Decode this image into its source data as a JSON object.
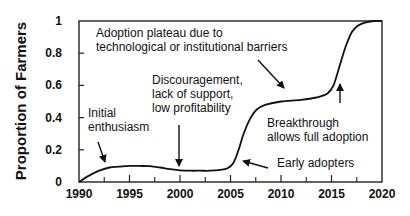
{
  "chart_data": {
    "type": "line",
    "title": "",
    "xlabel": "",
    "ylabel": "Proportion of Farmers",
    "xlim": [
      1990,
      2020
    ],
    "ylim": [
      0,
      1
    ],
    "grid": false,
    "legend": null,
    "x_ticks": [
      1990,
      1995,
      2000,
      2005,
      2010,
      2015,
      2020
    ],
    "x_minor_ticks": [
      1992.5,
      1997.5,
      2002.5,
      2007.5,
      2012.5,
      2017.5
    ],
    "y_ticks": [
      0,
      0.2,
      0.4,
      0.6,
      0.8,
      1
    ],
    "y_tick_labels": [
      "0",
      "0.2",
      "0.4",
      "0.6",
      "0.8",
      "1"
    ],
    "x_tick_labels": [
      "1990",
      "1995",
      "2000",
      "2005",
      "2010",
      "2015",
      "2020"
    ],
    "series": [
      {
        "name": "Adoption",
        "x": [
          1990,
          1991,
          1992,
          1993,
          1994,
          1995,
          1996,
          1997,
          1998,
          1999,
          2000,
          2001,
          2002,
          2003,
          2004,
          2004.7,
          2005.3,
          2005.8,
          2006.3,
          2007,
          2007.6,
          2008.5,
          2010,
          2012,
          2013.5,
          2014.6,
          2015.2,
          2015.8,
          2016.4,
          2017,
          2017.6,
          2018.3,
          2019.2,
          2020
        ],
        "values": [
          0,
          0.04,
          0.07,
          0.09,
          0.095,
          0.1,
          0.1,
          0.098,
          0.09,
          0.08,
          0.072,
          0.07,
          0.07,
          0.07,
          0.075,
          0.085,
          0.12,
          0.2,
          0.3,
          0.4,
          0.45,
          0.48,
          0.5,
          0.51,
          0.525,
          0.55,
          0.6,
          0.72,
          0.84,
          0.93,
          0.97,
          0.99,
          1.0,
          1.0
        ]
      }
    ],
    "annotations": [
      {
        "id": "initial",
        "lines": [
          "Initial",
          "enthusiasm"
        ],
        "arrow_to": [
          1993,
          0.1
        ]
      },
      {
        "id": "discouragement",
        "lines": [
          "Discouragement,",
          "lack of support,",
          "low profitability"
        ],
        "arrow_to": [
          2000,
          0.075
        ]
      },
      {
        "id": "plateau",
        "lines": [
          "Adoption plateau due to",
          "technological or institutional barriers"
        ],
        "arrow_to": [
          2009,
          0.49
        ]
      },
      {
        "id": "early",
        "lines": [
          "Early adopters"
        ],
        "arrow_to": [
          2006,
          0.13
        ]
      },
      {
        "id": "breakthrough",
        "lines": [
          "Breakthrough",
          "allows full adoption"
        ],
        "arrow_to": [
          2016,
          0.66
        ]
      }
    ]
  }
}
